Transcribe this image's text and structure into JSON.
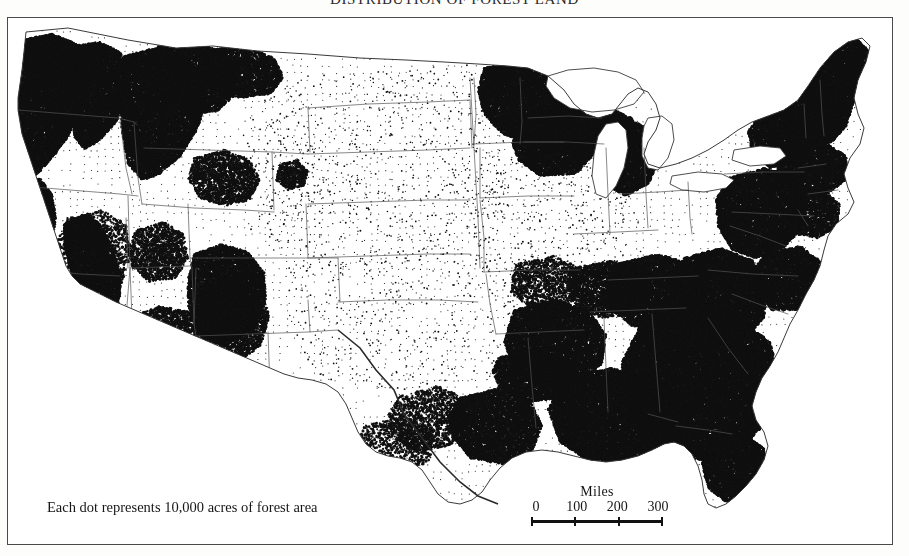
{
  "title": "DISTRIBUTION OF FOREST LAND",
  "legend": {
    "dot_note": "Each dot represents 10,000 acres of forest area",
    "scale_title": "Miles",
    "scale_ticks": [
      "0",
      "100",
      "200",
      "300"
    ]
  },
  "colors": {
    "paper": "#fdfdfc",
    "map_background": "#ffffff",
    "dot": "#101010",
    "boundary": "#555555",
    "coastline": "#3a3a3a",
    "neatline": "#4a4a4a"
  },
  "chart_data": {
    "type": "dot-density-map",
    "title": "DISTRIBUTION OF FOREST LAND",
    "unit": "10,000 acres of forest area per dot",
    "region": "Conterminous United States",
    "scale_bar": {
      "label": "Miles",
      "ticks": [
        0,
        100,
        200,
        300
      ]
    },
    "density_legend": [
      {
        "level": "very-high",
        "description": "near-solid black dot coverage"
      },
      {
        "level": "high",
        "description": "heavy clustered dots"
      },
      {
        "level": "moderate",
        "description": "scattered clustered dots"
      },
      {
        "level": "low",
        "description": "sparse regular stipple"
      }
    ],
    "regions": [
      {
        "name": "Pacific Northwest (WA, OR Cascades & Coast Range)",
        "density": "very-high",
        "value": 95
      },
      {
        "name": "Northern California Coast Ranges",
        "density": "very-high",
        "value": 90
      },
      {
        "name": "Sierra Nevada",
        "density": "high",
        "value": 78
      },
      {
        "name": "California Central Valley",
        "density": "low",
        "value": 8
      },
      {
        "name": "Northern Rocky Mountains (ID, MT)",
        "density": "high",
        "value": 80
      },
      {
        "name": "Colorado Rockies",
        "density": "high",
        "value": 72
      },
      {
        "name": "Great Basin (NV, UT)",
        "density": "low",
        "value": 12
      },
      {
        "name": "Arizona / New Mexico mountains",
        "density": "moderate",
        "value": 40
      },
      {
        "name": "Sonoran / Mojave Desert",
        "density": "low",
        "value": 4
      },
      {
        "name": "Great Plains (ND, SD, NE, KS, OK panhandle)",
        "density": "low",
        "value": 5
      },
      {
        "name": "Northern Lake States (MN, WI, MI)",
        "density": "very-high",
        "value": 92
      },
      {
        "name": "Corn Belt (IA, IL, IN, OH)",
        "density": "low",
        "value": 10
      },
      {
        "name": "Ozark Highlands (MO, AR)",
        "density": "high",
        "value": 76
      },
      {
        "name": "East Texas Piney Woods",
        "density": "high",
        "value": 70
      },
      {
        "name": "West Texas plains",
        "density": "low",
        "value": 6
      },
      {
        "name": "Gulf Coastal Plain (LA, MS, AL)",
        "density": "very-high",
        "value": 94
      },
      {
        "name": "Southern Appalachians",
        "density": "very-high",
        "value": 93
      },
      {
        "name": "Southeastern Coastal Plain (GA, SC, NC)",
        "density": "very-high",
        "value": 95
      },
      {
        "name": "North Florida",
        "density": "very-high",
        "value": 88
      },
      {
        "name": "South Florida / Everglades",
        "density": "low",
        "value": 9
      },
      {
        "name": "Mid-Atlantic (PA, NY, WV, VA)",
        "density": "very-high",
        "value": 90
      },
      {
        "name": "Northern New England (ME, NH, VT)",
        "density": "very-high",
        "value": 97
      }
    ]
  }
}
